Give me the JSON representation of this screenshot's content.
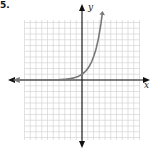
{
  "problem_label": "5.",
  "chart_data": {
    "type": "line",
    "title": "",
    "xlabel": "x",
    "ylabel": "y",
    "grid": true,
    "xlim": [
      -10,
      10
    ],
    "ylim": [
      -10,
      10
    ],
    "series": [
      {
        "name": "exponential growth curve",
        "function": "y = 2^x",
        "x": [
          -10,
          -8,
          -6,
          -4,
          -2,
          -1,
          0,
          1,
          2,
          3,
          3.5
        ],
        "values": [
          0.001,
          0.004,
          0.016,
          0.0625,
          0.25,
          0.5,
          1,
          2,
          4,
          8,
          11.3
        ]
      }
    ],
    "annotations": [
      "left arrow on curve (asymptote y=0)",
      "arrow on curve upper end"
    ]
  },
  "colors": {
    "grid": "#cfcfcf",
    "axis": "#111111",
    "curve": "#777777"
  }
}
